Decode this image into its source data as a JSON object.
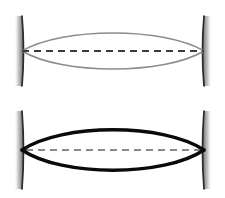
{
  "figure": {
    "background_color": "#ffffff",
    "width": 225,
    "height": 198,
    "panel_count": 2
  },
  "colors": {
    "beam_weak": "#8c8c8c",
    "beam_strong": "#0a0a0a",
    "mirror_line": "#2b2b2b",
    "mirror_shadow_dark": "#6e6e6e",
    "mirror_shadow_light": "#ffffff",
    "axis_dash_top": "#3a3a3a",
    "axis_dash_bottom": "#8a8a8a",
    "background": "#ffffff"
  },
  "panels": [
    {
      "id": "top",
      "name": "thin-gray-beam-cavity",
      "label": "Upper cavity with narrow low-contrast beam envelope",
      "beam": {
        "color": "#8c8c8c",
        "stroke_width": 1.6,
        "waist_half_height": 24,
        "apex_y": 27,
        "lower_apex_y": 75,
        "axis_y": 51,
        "left_focus_x": 22,
        "right_focus_x": 204,
        "shape": "biconvex-lens-envelope"
      },
      "axis": {
        "name": "optical-axis",
        "style": "dashed",
        "color": "#3a3a3a",
        "stroke_width": 2.0,
        "dash_pattern": "7 5",
        "y": 51,
        "x_start": 22,
        "x_end": 204
      },
      "mirrors": [
        {
          "name": "left-mirror",
          "side": "left",
          "x": 22,
          "y_top": 16,
          "y_bottom": 86,
          "bulge": 3,
          "shadow_side": "left"
        },
        {
          "name": "right-mirror",
          "side": "right",
          "x": 204,
          "y_top": 16,
          "y_bottom": 86,
          "bulge": 3,
          "shadow_side": "right"
        }
      ]
    },
    {
      "id": "bottom",
      "name": "thick-black-beam-cavity",
      "label": "Lower cavity with wide high-contrast beam envelope",
      "beam": {
        "color": "#0a0a0a",
        "stroke_width": 3.4,
        "waist_half_height": 28,
        "apex_y": 24,
        "lower_apex_y": 78,
        "axis_y": 51,
        "left_focus_x": 22,
        "right_focus_x": 204,
        "shape": "biconvex-lens-envelope"
      },
      "axis": {
        "name": "optical-axis",
        "style": "dashed",
        "color": "#8a8a8a",
        "stroke_width": 2.0,
        "dash_pattern": "7 5",
        "y": 51,
        "x_start": 26,
        "x_end": 200
      },
      "mirrors": [
        {
          "name": "left-mirror",
          "side": "left",
          "x": 22,
          "y_top": 12,
          "y_bottom": 90,
          "bulge": 3,
          "shadow_side": "left"
        },
        {
          "name": "right-mirror",
          "side": "right",
          "x": 204,
          "y_top": 12,
          "y_bottom": 90,
          "bulge": 3,
          "shadow_side": "right"
        }
      ]
    }
  ]
}
